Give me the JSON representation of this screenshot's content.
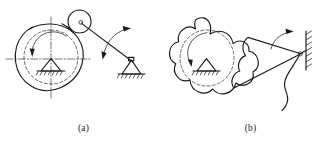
{
  "figure": {
    "background_color": "#ffffff",
    "ink_color": "#1b1b1b",
    "panels": [
      {
        "id": "a",
        "caption": "(a)",
        "description": "Disk cam with oscillating roller follower",
        "elements": [
          {
            "name": "cam-profile",
            "type": "closed-irregular-disk",
            "style": "solid"
          },
          {
            "name": "base-circle",
            "type": "circle",
            "style": "dashed"
          },
          {
            "name": "horizontal-centerline",
            "type": "line",
            "style": "dash-dot"
          },
          {
            "name": "vertical-centerline",
            "type": "line",
            "style": "dash-dot"
          },
          {
            "name": "cam-pivot-ground",
            "type": "triangle-hatched-support",
            "style": "solid"
          },
          {
            "name": "cam-rotation-arrow",
            "type": "curved-arrow",
            "style": "solid"
          },
          {
            "name": "roller-follower",
            "type": "circle",
            "style": "solid"
          },
          {
            "name": "roller-pin",
            "type": "small-circle",
            "style": "solid"
          },
          {
            "name": "follower-arm",
            "type": "line",
            "style": "solid"
          },
          {
            "name": "follower-oscillation-arrow",
            "type": "double-curved-arrow",
            "style": "solid"
          },
          {
            "name": "follower-pivot-ground",
            "type": "triangle-hatched-support",
            "style": "solid"
          }
        ]
      },
      {
        "id": "b",
        "caption": "(b)",
        "description": "Lobed plate cam with oscillating flat-faced follower",
        "elements": [
          {
            "name": "cam-profile",
            "type": "closed-lobed-plate",
            "style": "solid"
          },
          {
            "name": "base-circle",
            "type": "circle",
            "style": "dashed"
          },
          {
            "name": "cam-pivot-ground",
            "type": "triangle-hatched-support",
            "style": "solid"
          },
          {
            "name": "cam-rotation-arrow",
            "type": "curved-arrow",
            "style": "solid"
          },
          {
            "name": "follower-body",
            "type": "closed-wedge",
            "style": "solid"
          },
          {
            "name": "follower-oscillation-arrow",
            "type": "curved-arrow",
            "style": "solid"
          },
          {
            "name": "follower-pivot",
            "type": "small-circle",
            "style": "solid"
          },
          {
            "name": "wall-hatched-ground",
            "type": "hatched-wall",
            "style": "solid"
          },
          {
            "name": "spring-return-link",
            "type": "wavy-line",
            "style": "solid"
          }
        ]
      }
    ]
  }
}
